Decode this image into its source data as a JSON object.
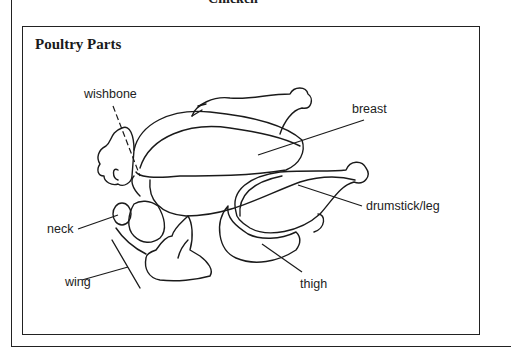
{
  "page": {
    "title": "Chicken"
  },
  "figure": {
    "title": "Poultry Parts",
    "labels": {
      "wishbone": "wishbone",
      "breast": "breast",
      "drumstick": "drumstick/leg",
      "neck": "neck",
      "wing": "wing",
      "thigh": "thigh"
    }
  }
}
